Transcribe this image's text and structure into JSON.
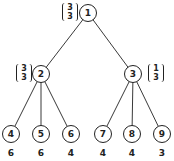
{
  "tree": {
    "root": {
      "id": "1",
      "vector": [
        "3",
        "3"
      ]
    },
    "level1": [
      {
        "id": "2",
        "vector": [
          "3",
          "3"
        ],
        "vector_side": "left"
      },
      {
        "id": "3",
        "vector": [
          "1",
          "3"
        ],
        "vector_side": "right"
      }
    ],
    "leaves": [
      {
        "id": "4",
        "value": "6"
      },
      {
        "id": "5",
        "value": "6"
      },
      {
        "id": "6",
        "value": "4"
      },
      {
        "id": "7",
        "value": "4"
      },
      {
        "id": "8",
        "value": "4"
      },
      {
        "id": "9",
        "value": "3"
      }
    ],
    "colors": {
      "stroke": "#222222",
      "background": "#ffffff"
    }
  }
}
